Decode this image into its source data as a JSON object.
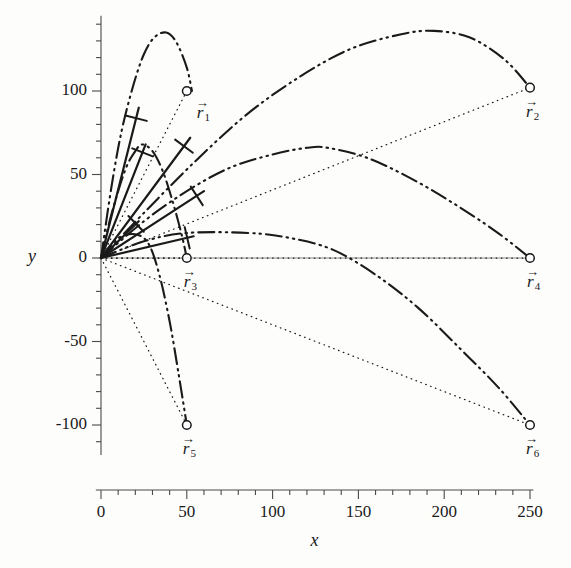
{
  "figure": {
    "background": "#fdfdfc",
    "ink": "#1a1a1a",
    "axis_color": "#4a4a4a"
  },
  "axes": {
    "x_name": "x",
    "y_name": "y",
    "x_ticks": [
      "0",
      "50",
      "100",
      "150",
      "200",
      "250"
    ],
    "y_ticks": [
      "100",
      "50",
      "0",
      "-50",
      "-100"
    ]
  },
  "chart_data": {
    "type": "line",
    "title": "",
    "xlabel": "x",
    "ylabel": "y",
    "xlim": [
      0,
      250
    ],
    "ylim": [
      -115,
      145
    ],
    "grid": false,
    "legend": "none",
    "x_ticks": [
      0,
      50,
      100,
      150,
      200,
      250
    ],
    "y_ticks": [
      100,
      50,
      0,
      -50,
      -100
    ],
    "x_minor_step": 10,
    "y_minor_step": 10,
    "markers": [
      {
        "label": "r1",
        "x": 50,
        "y": 100
      },
      {
        "label": "r2",
        "x": 250,
        "y": 102
      },
      {
        "label": "r3",
        "x": 50,
        "y": 0
      },
      {
        "label": "r4",
        "x": 250,
        "y": 0
      },
      {
        "label": "r5",
        "x": 50,
        "y": -100
      },
      {
        "label": "r6",
        "x": 250,
        "y": -100
      }
    ],
    "series": [
      {
        "name": "trajectory-1",
        "endpoint": [
          50,
          100
        ],
        "apex": [
          38,
          135
        ],
        "points": [
          [
            0,
            0
          ],
          [
            6,
            42
          ],
          [
            12,
            76
          ],
          [
            19,
            104
          ],
          [
            25,
            122
          ],
          [
            31,
            132
          ],
          [
            38,
            135
          ],
          [
            44,
            129
          ],
          [
            50,
            114
          ],
          [
            53,
            100
          ]
        ]
      },
      {
        "name": "trajectory-2",
        "endpoint": [
          250,
          102
        ],
        "apex": [
          194,
          136
        ],
        "points": [
          [
            0,
            0
          ],
          [
            25,
            27
          ],
          [
            55,
            58
          ],
          [
            85,
            86
          ],
          [
            115,
            108
          ],
          [
            145,
            125
          ],
          [
            175,
            134
          ],
          [
            194,
            136
          ],
          [
            215,
            132
          ],
          [
            235,
            119
          ],
          [
            250,
            102
          ]
        ]
      },
      {
        "name": "trajectory-3",
        "endpoint": [
          50,
          0
        ],
        "apex": [
          24,
          68
        ],
        "points": [
          [
            0,
            0
          ],
          [
            5,
            22
          ],
          [
            10,
            40
          ],
          [
            15,
            55
          ],
          [
            20,
            64
          ],
          [
            24,
            68
          ],
          [
            30,
            64
          ],
          [
            36,
            52
          ],
          [
            42,
            33
          ],
          [
            47,
            14
          ],
          [
            50,
            0
          ]
        ]
      },
      {
        "name": "trajectory-4",
        "endpoint": [
          250,
          0
        ],
        "apex": [
          132,
          66
        ],
        "points": [
          [
            0,
            0
          ],
          [
            25,
            22
          ],
          [
            50,
            40
          ],
          [
            75,
            54
          ],
          [
            100,
            62
          ],
          [
            120,
            66
          ],
          [
            132,
            66
          ],
          [
            155,
            60
          ],
          [
            180,
            48
          ],
          [
            205,
            33
          ],
          [
            230,
            16
          ],
          [
            250,
            0
          ]
        ]
      },
      {
        "name": "trajectory-5",
        "endpoint": [
          50,
          -100
        ],
        "apex": [
          21,
          14
        ],
        "points": [
          [
            0,
            0
          ],
          [
            6,
            8
          ],
          [
            12,
            13
          ],
          [
            21,
            14
          ],
          [
            28,
            8
          ],
          [
            34,
            -10
          ],
          [
            40,
            -38
          ],
          [
            45,
            -68
          ],
          [
            50,
            -100
          ]
        ]
      },
      {
        "name": "trajectory-6",
        "endpoint": [
          250,
          -100
        ],
        "apex": [
          86,
          15
        ],
        "points": [
          [
            0,
            0
          ],
          [
            25,
            10
          ],
          [
            50,
            15
          ],
          [
            86,
            15
          ],
          [
            110,
            12
          ],
          [
            135,
            5
          ],
          [
            160,
            -10
          ],
          [
            185,
            -30
          ],
          [
            210,
            -55
          ],
          [
            232,
            -78
          ],
          [
            250,
            -100
          ]
        ]
      }
    ],
    "velocity_vectors": [
      {
        "name": "v1",
        "from": [
          0,
          0
        ],
        "to": [
          22,
          90
        ]
      },
      {
        "name": "v2",
        "from": [
          0,
          0
        ],
        "to": [
          26,
          68
        ]
      },
      {
        "name": "v3",
        "from": [
          0,
          0
        ],
        "to": [
          52,
          72
        ]
      },
      {
        "name": "v4",
        "from": [
          0,
          0
        ],
        "to": [
          60,
          40
        ]
      },
      {
        "name": "v5",
        "from": [
          0,
          0
        ],
        "to": [
          22,
          22
        ]
      },
      {
        "name": "v6",
        "from": [
          0,
          0
        ],
        "to": [
          54,
          13
        ]
      }
    ]
  },
  "vector_labels": [
    {
      "name": "r1",
      "glyph": "r",
      "sub": "1"
    },
    {
      "name": "r2",
      "glyph": "r",
      "sub": "2"
    },
    {
      "name": "r3",
      "glyph": "r",
      "sub": "3"
    },
    {
      "name": "r4",
      "glyph": "r",
      "sub": "4"
    },
    {
      "name": "r5",
      "glyph": "r",
      "sub": "5"
    },
    {
      "name": "r6",
      "glyph": "r",
      "sub": "6"
    }
  ]
}
